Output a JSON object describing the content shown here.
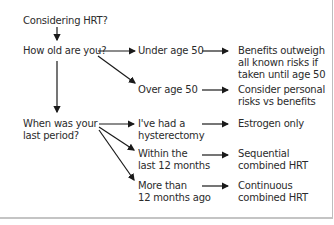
{
  "diagram": {
    "title": "Considering HRT?",
    "questions": {
      "age": "How old are you?",
      "period": "When was your\nlast period?"
    },
    "age_options": [
      {
        "label": "Under age 50",
        "result": "Benefits outweigh\nall known risks if\ntaken until age 50"
      },
      {
        "label": "Over age 50",
        "result": "Consider personal\nrisks vs benefits"
      }
    ],
    "period_options": [
      {
        "label": "I've had a\nhysterectomy",
        "result": "Estrogen only"
      },
      {
        "label": "Within the\nlast 12 months",
        "result": "Sequential\ncombined HRT"
      },
      {
        "label": "More than\n12 months ago",
        "result": "Continuous\ncombined HRT"
      }
    ],
    "colors": {
      "text": "#2b2b2b",
      "arrow": "#1a1a1a",
      "border": "#c4c4c4"
    }
  }
}
